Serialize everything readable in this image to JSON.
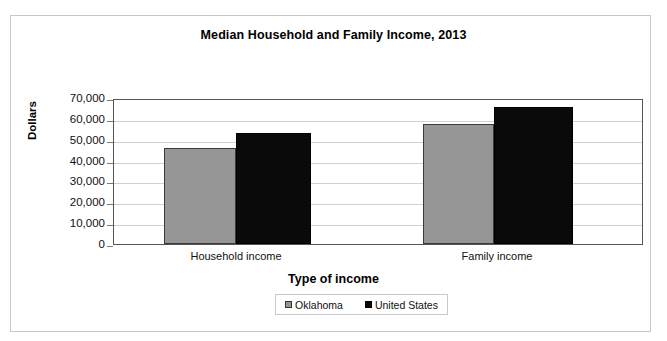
{
  "chart_data": {
    "type": "bar",
    "title": "Median Household and Family Income, 2013",
    "xlabel": "Type of income",
    "ylabel": "Dollars",
    "categories": [
      "Household income",
      "Family income"
    ],
    "series": [
      {
        "name": "Oklahoma",
        "color": "#969696",
        "values": [
          46000,
          57500
        ]
      },
      {
        "name": "United States",
        "color": "#0a0a0a",
        "values": [
          53000,
          65500
        ]
      }
    ],
    "ylim": [
      0,
      70000
    ],
    "ytick_labels": [
      "70,000",
      "60,000",
      "50,000",
      "40,000",
      "30,000",
      "20,000",
      "10,000",
      "0"
    ],
    "ytick_values": [
      70000,
      60000,
      50000,
      40000,
      30000,
      20000,
      10000,
      0
    ],
    "grid": true,
    "legend_position": "bottom"
  },
  "legend": {
    "items": [
      {
        "label": "Oklahoma"
      },
      {
        "label": "United States"
      }
    ]
  }
}
